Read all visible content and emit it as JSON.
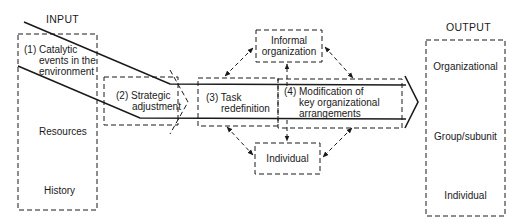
{
  "diagram": {
    "input": {
      "header": "INPUT",
      "items": [
        {
          "line1": "(1) Catalytic",
          "line2": "events in the",
          "line3": "environment"
        },
        {
          "label": "Resources"
        },
        {
          "label": "History"
        }
      ]
    },
    "process": {
      "strategic_adjustment": {
        "line1": "(2) Strategic",
        "line2": "adjustment"
      },
      "task_redefinition": {
        "line1": "(3) Task",
        "line2": "redefinition"
      },
      "modification": {
        "line1": "(4) Modification of",
        "line2": "key organizational",
        "line3": "arrangements"
      }
    },
    "influences": {
      "informal_organization": {
        "line1": "Informal",
        "line2": "organization"
      },
      "individual": {
        "label": "Individual"
      }
    },
    "output": {
      "header": "OUTPUT",
      "items": [
        "Organizational",
        "Group/subunit",
        "Individual"
      ]
    }
  }
}
